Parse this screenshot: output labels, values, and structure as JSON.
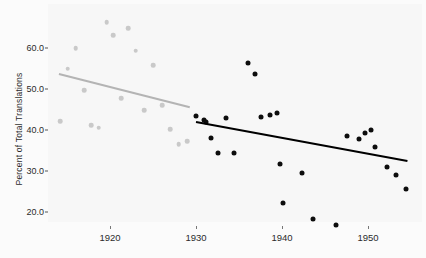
{
  "chart_data": {
    "type": "scatter",
    "title": "",
    "xlabel": "",
    "ylabel": "Percent of Total Translations",
    "xlim": [
      1913.5,
      1956.5
    ],
    "ylim": [
      16.0,
      68.0
    ],
    "grid": false,
    "legend": null,
    "xticks": [
      1920,
      1930,
      1940,
      1950
    ],
    "xticklabels": [
      "1920",
      "1930",
      "1940",
      "1950"
    ],
    "yticks": [
      20.0,
      30.0,
      40.0,
      50.0,
      60.0
    ],
    "yticklabels": [
      "20.0",
      "30.0",
      "40.0",
      "50.0",
      "60.0"
    ],
    "colors": {
      "early_points": "#c9c9c9",
      "early_trend": "#b4b4b4",
      "late_points": "#0d0d0d",
      "late_trend": "#000000",
      "plot_background": "#f7f7f7",
      "figure_background": "#fbfbfb",
      "text": "#2b2b2b"
    },
    "series": [
      {
        "name": "early_period_points",
        "marker": "circle",
        "color": "#c9c9c9",
        "points": [
          {
            "x": 1914.2,
            "y": 42.2
          },
          {
            "x": 1915.1,
            "y": 55.0
          },
          {
            "x": 1916.0,
            "y": 59.9
          },
          {
            "x": 1917.0,
            "y": 49.7
          },
          {
            "x": 1917.8,
            "y": 41.1
          },
          {
            "x": 1918.7,
            "y": 40.6
          },
          {
            "x": 1919.6,
            "y": 66.3
          },
          {
            "x": 1920.4,
            "y": 63.1
          },
          {
            "x": 1921.3,
            "y": 47.8
          },
          {
            "x": 1922.1,
            "y": 64.9
          },
          {
            "x": 1923.0,
            "y": 59.3
          },
          {
            "x": 1924.0,
            "y": 44.9
          },
          {
            "x": 1925.0,
            "y": 55.8
          },
          {
            "x": 1926.1,
            "y": 46.0
          },
          {
            "x": 1927.0,
            "y": 40.2
          },
          {
            "x": 1928.0,
            "y": 36.5
          },
          {
            "x": 1929.0,
            "y": 37.3
          }
        ]
      },
      {
        "name": "early_period_trend",
        "type": "line",
        "color": "#b4b4b4",
        "x": [
          1914.1,
          1929.3
        ],
        "y": [
          53.8,
          45.7
        ]
      },
      {
        "name": "late_period_points",
        "marker": "circle",
        "color": "#0d0d0d",
        "points": [
          {
            "x": 1930.0,
            "y": 43.3
          },
          {
            "x": 1930.9,
            "y": 42.5
          },
          {
            "x": 1931.2,
            "y": 42.0
          },
          {
            "x": 1931.8,
            "y": 38.0
          },
          {
            "x": 1932.6,
            "y": 34.5
          },
          {
            "x": 1933.5,
            "y": 43.0
          },
          {
            "x": 1934.4,
            "y": 34.3
          },
          {
            "x": 1936.0,
            "y": 56.4
          },
          {
            "x": 1936.9,
            "y": 53.7
          },
          {
            "x": 1937.5,
            "y": 43.2
          },
          {
            "x": 1938.6,
            "y": 43.6
          },
          {
            "x": 1939.4,
            "y": 44.1
          },
          {
            "x": 1939.8,
            "y": 31.6
          },
          {
            "x": 1940.1,
            "y": 22.1
          },
          {
            "x": 1942.3,
            "y": 29.6
          },
          {
            "x": 1943.6,
            "y": 18.4
          },
          {
            "x": 1946.3,
            "y": 16.8
          },
          {
            "x": 1947.6,
            "y": 38.6
          },
          {
            "x": 1949.0,
            "y": 37.7
          },
          {
            "x": 1949.6,
            "y": 39.2
          },
          {
            "x": 1950.4,
            "y": 40.0
          },
          {
            "x": 1950.8,
            "y": 35.9
          },
          {
            "x": 1952.2,
            "y": 31.0
          },
          {
            "x": 1953.3,
            "y": 29.0
          },
          {
            "x": 1954.4,
            "y": 25.5
          }
        ]
      },
      {
        "name": "late_period_trend",
        "type": "line",
        "color": "#000000",
        "x": [
          1930.0,
          1954.6
        ],
        "y": [
          42.1,
          32.6
        ]
      }
    ]
  }
}
